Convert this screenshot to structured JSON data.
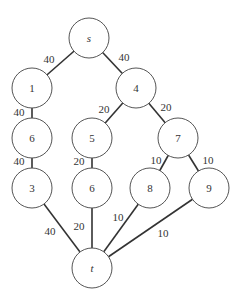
{
  "diagram": {
    "type": "flow-network",
    "nodes": [
      {
        "id": "s",
        "label": "s",
        "italic": true,
        "x": 89,
        "y": 38
      },
      {
        "id": "n1",
        "label": "1",
        "italic": false,
        "x": 32,
        "y": 88
      },
      {
        "id": "n4",
        "label": "4",
        "italic": false,
        "x": 136,
        "y": 88
      },
      {
        "id": "n6a",
        "label": "6",
        "italic": false,
        "x": 32,
        "y": 138
      },
      {
        "id": "n5",
        "label": "5",
        "italic": false,
        "x": 92,
        "y": 138
      },
      {
        "id": "n7",
        "label": "7",
        "italic": false,
        "x": 178,
        "y": 138
      },
      {
        "id": "n3",
        "label": "3",
        "italic": false,
        "x": 32,
        "y": 188
      },
      {
        "id": "n6b",
        "label": "6",
        "italic": false,
        "x": 92,
        "y": 188
      },
      {
        "id": "n8",
        "label": "8",
        "italic": false,
        "x": 150,
        "y": 188
      },
      {
        "id": "n9",
        "label": "9",
        "italic": false,
        "x": 209,
        "y": 188
      },
      {
        "id": "t",
        "label": "t",
        "italic": true,
        "x": 92,
        "y": 268
      }
    ],
    "edges": [
      {
        "from": "s",
        "to": "n1",
        "capacity": "40",
        "lx": 49,
        "ly": 59
      },
      {
        "from": "s",
        "to": "n4",
        "capacity": "40",
        "lx": 124,
        "ly": 57
      },
      {
        "from": "n1",
        "to": "n6a",
        "capacity": "40",
        "lx": 19,
        "ly": 112
      },
      {
        "from": "n4",
        "to": "n5",
        "capacity": "20",
        "lx": 104,
        "ly": 109
      },
      {
        "from": "n4",
        "to": "n7",
        "capacity": "20",
        "lx": 166,
        "ly": 107
      },
      {
        "from": "n6a",
        "to": "n3",
        "capacity": "40",
        "lx": 19,
        "ly": 161
      },
      {
        "from": "n5",
        "to": "n6b",
        "capacity": "20",
        "lx": 79,
        "ly": 161
      },
      {
        "from": "n7",
        "to": "n8",
        "capacity": "10",
        "lx": 156,
        "ly": 160
      },
      {
        "from": "n7",
        "to": "n9",
        "capacity": "10",
        "lx": 208,
        "ly": 160
      },
      {
        "from": "n3",
        "to": "t",
        "capacity": "40",
        "lx": 50,
        "ly": 231
      },
      {
        "from": "n6b",
        "to": "t",
        "capacity": "20",
        "lx": 79,
        "ly": 226
      },
      {
        "from": "n8",
        "to": "t",
        "capacity": "10",
        "lx": 118,
        "ly": 217
      },
      {
        "from": "n9",
        "to": "t",
        "capacity": "10",
        "lx": 163,
        "ly": 233
      }
    ],
    "node_radius": 20
  }
}
